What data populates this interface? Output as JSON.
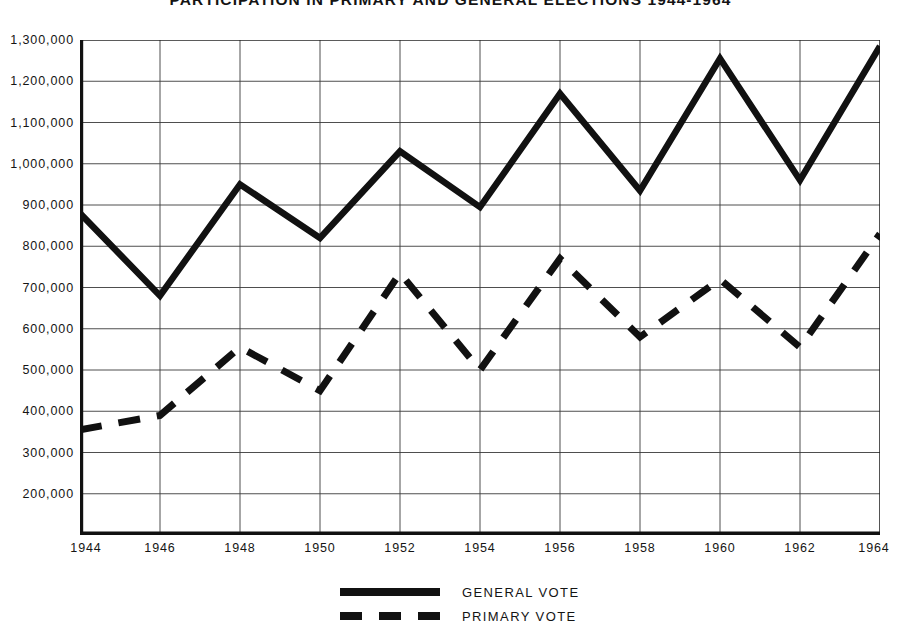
{
  "chart_data": {
    "type": "line",
    "title": "PARTICIPATION IN PRIMARY AND GENERAL ELECTIONS 1944-1964",
    "xlabel": "",
    "ylabel": "",
    "grid": true,
    "legend_position": "bottom-center",
    "x": [
      1944,
      1946,
      1948,
      1950,
      1952,
      1954,
      1956,
      1958,
      1960,
      1962,
      1964
    ],
    "categories": [
      "1944",
      "1946",
      "1948",
      "1950",
      "1952",
      "1954",
      "1956",
      "1958",
      "1960",
      "1962",
      "1964"
    ],
    "xlim": [
      1944,
      1964
    ],
    "ylim": [
      100000,
      1300000
    ],
    "ytick_values": [
      200000,
      300000,
      400000,
      500000,
      600000,
      700000,
      800000,
      900000,
      1000000,
      1100000,
      1200000,
      1300000
    ],
    "ytick_labels": [
      "200,000",
      "300,000",
      "400,000",
      "500,000",
      "600,000",
      "700,000",
      "800,000",
      "900,000",
      "1,000,000",
      "1,100,000",
      "1,200,000",
      "1,300,000"
    ],
    "series": [
      {
        "name": "GENERAL VOTE",
        "style": "solid",
        "color": "#111111",
        "values": [
          880000,
          680000,
          950000,
          820000,
          1030000,
          895000,
          1170000,
          935000,
          1255000,
          960000,
          1285000
        ]
      },
      {
        "name": "PRIMARY VOTE",
        "style": "dashed",
        "color": "#111111",
        "values": [
          355000,
          390000,
          555000,
          450000,
          735000,
          500000,
          770000,
          580000,
          720000,
          555000,
          830000
        ]
      }
    ]
  },
  "legend": {
    "items": [
      {
        "label": "GENERAL VOTE",
        "style": "solid"
      },
      {
        "label": "PRIMARY VOTE",
        "style": "dashed"
      }
    ]
  }
}
